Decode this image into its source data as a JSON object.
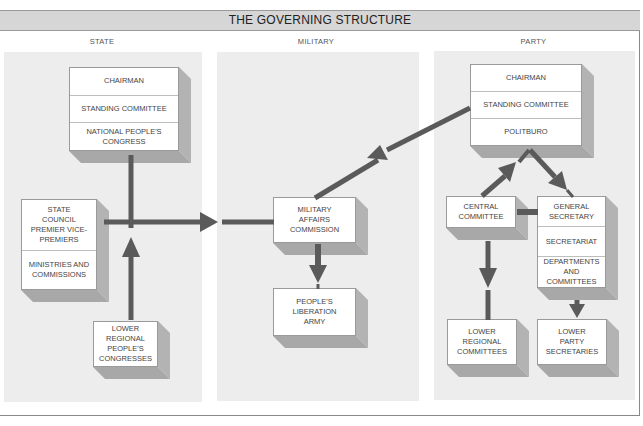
{
  "title": "THE GOVERNING STRUCTURE",
  "columns": {
    "state": {
      "label": "STATE",
      "top_box": [
        "CHAIRMAN",
        "STANDING COMMITTEE",
        "NATIONAL PEOPLE'S CONGRESS"
      ],
      "council_box": [
        "STATE COUNCIL PREMIER VICE-PREMIERS",
        "MINISTRIES AND COMMISSIONS"
      ],
      "lower_box": [
        "LOWER REGIONAL PEOPLE'S CONGRESSES"
      ]
    },
    "military": {
      "label": "MILITARY",
      "mac_box": [
        "MILITARY AFFAIRS COMMISSION"
      ],
      "pla_box": [
        "PEOPLE'S LIBERATION ARMY"
      ]
    },
    "party": {
      "label": "PARTY",
      "top_box": [
        "CHAIRMAN",
        "STANDING COMMITTEE",
        "POLITBURO"
      ],
      "central_box": [
        "CENTRAL COMMITTEE"
      ],
      "gensec_box": [
        "GENERAL SECRETARY",
        "SECRETARIAT",
        "DEPARTMENTS AND COMMITTEES"
      ],
      "lower_regional_box": [
        "LOWER REGIONAL COMMITTEES"
      ],
      "lower_secretaries_box": [
        "LOWER PARTY SECRETARIES"
      ]
    }
  },
  "connections": [
    {
      "from": "National People's Congress",
      "to": "State Council",
      "type": "line"
    },
    {
      "from": "State Council",
      "to": "Military Affairs Commission",
      "type": "arrow"
    },
    {
      "from": "Lower Regional People's Congresses",
      "to": "National People's Congress",
      "type": "arrow"
    },
    {
      "from": "Politburo",
      "to": "Military Affairs Commission",
      "type": "arrow"
    },
    {
      "from": "Military Affairs Commission",
      "to": "People's Liberation Army",
      "type": "arrow"
    },
    {
      "from": "Central Committee",
      "to": "Politburo",
      "type": "arrow"
    },
    {
      "from": "Politburo",
      "to": "General Secretary",
      "type": "arrow"
    },
    {
      "from": "Central Committee",
      "to": "General Secretary",
      "type": "line"
    },
    {
      "from": "Central Committee",
      "to": "Lower Regional Committees",
      "type": "arrow"
    },
    {
      "from": "Departments and Committees",
      "to": "Lower Party Secretaries",
      "type": "arrow"
    }
  ],
  "colors": {
    "arrow": "#5a5a5a",
    "panel": "#ededed",
    "title_bar": "#d6d6d6",
    "box_face": "#ffffff",
    "box_side": "#b3b3b3"
  }
}
